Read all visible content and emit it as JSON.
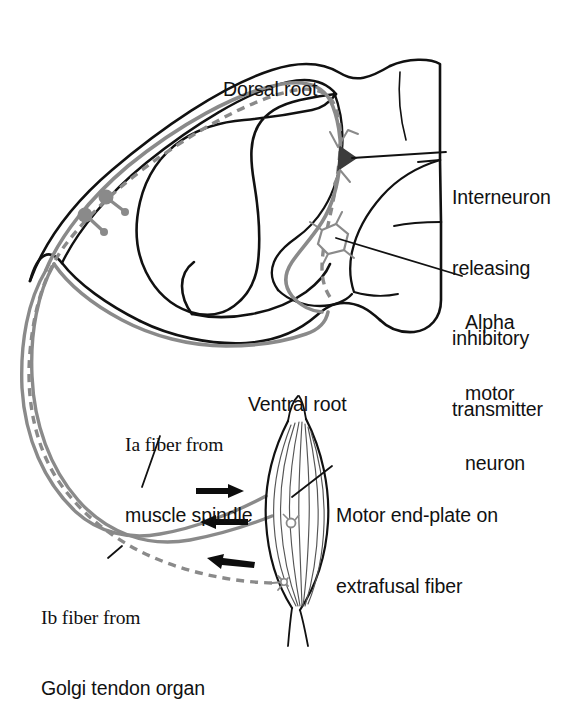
{
  "figure": {
    "background_color": "#ffffff",
    "outline_color": "#111111",
    "fiber_color": "#8a8a8a",
    "width": 577,
    "height": 650
  },
  "labels": {
    "dorsal_root": "Dorsal root",
    "ventral_root": "Ventral root",
    "interneuron": {
      "line1": "Interneuron",
      "line2": "releasing",
      "line3": "inhibitory",
      "line4": "transmitter"
    },
    "alpha_motor_neuron": {
      "line1": "Alpha",
      "line2": "motor",
      "line3": "neuron"
    },
    "ia_fiber": {
      "line1": "Ia fiber from",
      "line2": "muscle spindle"
    },
    "ib_fiber": {
      "line1": "Ib fiber from",
      "line2": "Golgi tendon organ"
    },
    "motor_end_plate": {
      "line1": "Motor end-plate on",
      "line2": "extrafusal fiber"
    }
  },
  "structures": {
    "spinal_cord": "spinal-cord-cross-section",
    "gray_matter": "butterfly-gray-matter",
    "dorsal_root_ganglion_cells": 2,
    "muscle": "skeletal-muscle-extrafusal-fibers",
    "arrows": [
      {
        "name": "arrow-to-muscle-top",
        "direction": "right"
      },
      {
        "name": "arrow-from-muscle-middle",
        "direction": "left"
      },
      {
        "name": "arrow-from-muscle-bottom",
        "direction": "left"
      }
    ],
    "fiber_styles": {
      "ia_fiber": "solid",
      "ib_fiber": "dashed",
      "motor_axon": "solid"
    }
  }
}
